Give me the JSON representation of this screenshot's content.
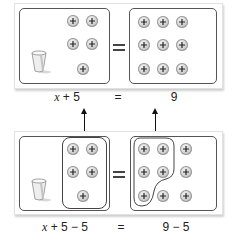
{
  "panels": [
    {
      "id": "top",
      "left_side": {
        "cup_count": 1,
        "counter_count": 5,
        "counter_symbol": "+"
      },
      "right_side": {
        "counter_count": 9,
        "counter_symbol": "+"
      },
      "equals_sign": "=",
      "equation": {
        "left": "x + 5",
        "equals": "=",
        "right": "9"
      }
    },
    {
      "id": "bottom",
      "left_side": {
        "cup_count": 1,
        "counter_count": 5,
        "counter_symbol": "+",
        "grouped_removed": 5
      },
      "right_side": {
        "counter_count": 9,
        "counter_symbol": "+",
        "grouped_removed": 5
      },
      "equals_sign": "=",
      "equation": {
        "left_var": "x",
        "left_rest": " + 5 − 5",
        "equals": "=",
        "right": "9 − 5"
      }
    }
  ],
  "top_label": {
    "var": "x",
    "rest": " + 5",
    "equals": "=",
    "right": "9"
  },
  "bottom_label": {
    "var": "x",
    "rest": " + 5 − 5",
    "equals": "=",
    "right": "9 − 5"
  },
  "colors": {
    "box_border": "#555555",
    "counter_fill": "#cfcfcf",
    "arrow": "#111111",
    "frame_shadow": "#cfcfcf"
  }
}
